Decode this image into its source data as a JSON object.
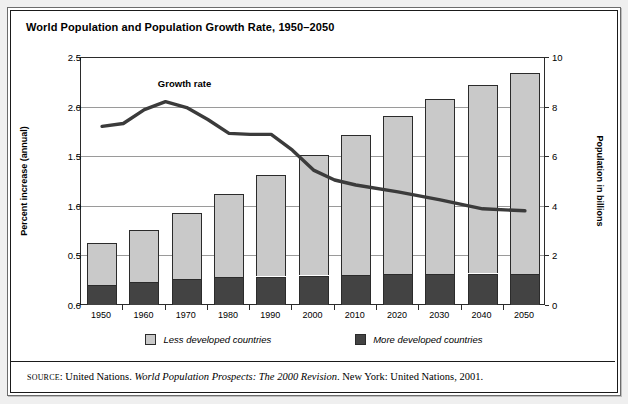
{
  "figure": {
    "title": "World Population and Population Growth Rate, 1950–2050"
  },
  "axes": {
    "left_label": "Percent increase (annual)",
    "right_label": "Population in billions",
    "left_ticks": [
      "0.0",
      "0.5",
      "1.0",
      "1.5",
      "2.0",
      "2.5"
    ],
    "right_ticks": [
      "0",
      "2",
      "4",
      "6",
      "8",
      "10"
    ]
  },
  "annotations": {
    "growth_rate_label": "Growth rate"
  },
  "legend": {
    "items": [
      {
        "label": "Less developed countries",
        "color": "#c9c9c9"
      },
      {
        "label": "More developed countries",
        "color": "#434343"
      }
    ]
  },
  "source": {
    "prefix": "SOURCE",
    "separator": ": ",
    "publisher": "United Nations. ",
    "work": "World Population Prospects: The 2000 Revision",
    "tail": ". New York: United Nations, 2001."
  },
  "chart_data": {
    "type": "bar",
    "title": "World Population and Population Growth Rate, 1950–2050",
    "xlabel": "",
    "ylabel": "Percent increase (annual)",
    "y2label": "Population in billions",
    "categories": [
      "1950",
      "1960",
      "1970",
      "1980",
      "1990",
      "2000",
      "2010",
      "2020",
      "2030",
      "2040",
      "2050"
    ],
    "ylim": [
      0.0,
      2.5
    ],
    "y2lim": [
      0,
      10
    ],
    "ytick_values": [
      0.0,
      0.5,
      1.0,
      1.5,
      2.0,
      2.5
    ],
    "y2tick_values": [
      0,
      2,
      4,
      6,
      8,
      10
    ],
    "grid": true,
    "legend_position": "bottom",
    "stacked": true,
    "series": [
      {
        "name": "More developed countries",
        "unit": "billions",
        "color": "#434343",
        "values": [
          0.81,
          0.94,
          1.05,
          1.14,
          1.15,
          1.19,
          1.22,
          1.24,
          1.26,
          1.27,
          1.25
        ]
      },
      {
        "name": "Less developed countries",
        "unit": "billions",
        "color": "#c9c9c9",
        "values": [
          1.71,
          2.07,
          2.65,
          3.33,
          4.1,
          4.87,
          5.62,
          6.38,
          7.05,
          7.61,
          8.11
        ]
      }
    ],
    "totals": {
      "name": "World population",
      "unit": "billions",
      "values": [
        2.52,
        3.01,
        3.7,
        4.47,
        5.25,
        6.06,
        6.84,
        7.62,
        8.31,
        8.88,
        9.36
      ]
    },
    "overlay_line": {
      "name": "Growth rate",
      "unit": "percent increase (annual)",
      "color": "#3b3b3b",
      "x": [
        "1950",
        "1955",
        "1960",
        "1965",
        "1970",
        "1975",
        "1980",
        "1985",
        "1990",
        "1995",
        "2000",
        "2005",
        "2010",
        "2020",
        "2030",
        "2040",
        "2050"
      ],
      "values": [
        1.8,
        1.83,
        1.97,
        2.05,
        1.99,
        1.87,
        1.73,
        1.72,
        1.72,
        1.56,
        1.36,
        1.26,
        1.21,
        1.14,
        1.06,
        0.97,
        0.95
      ]
    }
  }
}
